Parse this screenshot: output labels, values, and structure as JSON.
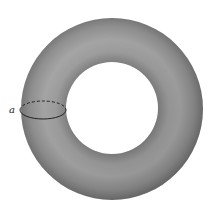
{
  "figure": {
    "type": "torus",
    "label": "a",
    "colors": {
      "background": "#ffffff",
      "torus_dark": "#6e6e6e",
      "torus_mid": "#8a8a8a",
      "torus_light": "#a6a6a6",
      "outline": "#222222"
    }
  }
}
